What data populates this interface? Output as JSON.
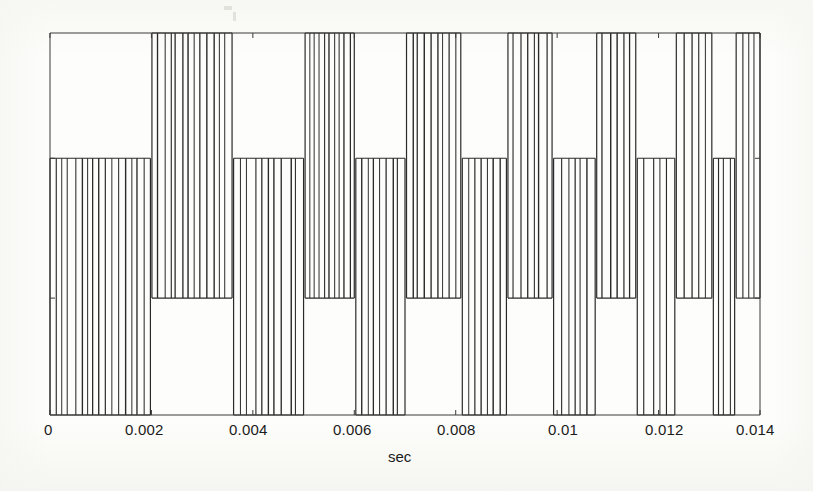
{
  "figure": {
    "background_color": "#fdfdfb",
    "line_color": "#2a2a2a",
    "axis_color": "#3a3a3a",
    "plot_box": {
      "left": 50,
      "top": 33,
      "right": 760,
      "bottom": 415
    }
  },
  "axis": {
    "x_label": "sec",
    "x_ticks": [
      "0",
      "0.002",
      "0.004",
      "0.006",
      "0.008",
      "0.01",
      "0.012",
      "0.014"
    ],
    "x_tick_values": [
      0,
      0.002,
      0.004,
      0.006,
      0.008,
      0.01,
      0.012,
      0.014
    ],
    "xlim": [
      0,
      0.014
    ],
    "y_ticks": [],
    "y_label": "",
    "grid": false,
    "box": true
  },
  "chart_data": {
    "type": "line",
    "title": "",
    "subtitle": "",
    "xlabel": "sec",
    "ylabel": "",
    "xlim": [
      0,
      0.014
    ],
    "ylim": [
      0,
      1
    ],
    "grid": false,
    "legend": null,
    "levels": {
      "high_top": 1.0,
      "high_bottom": 0.306,
      "low_top": 0.672,
      "low_bottom": 0.0
    },
    "blocks": [
      {
        "band": "low",
        "x_start": 0.0,
        "x_end": 0.00198,
        "n_lines": 15
      },
      {
        "band": "high",
        "x_start": 0.00201,
        "x_end": 0.00359,
        "n_lines": 12
      },
      {
        "band": "low",
        "x_start": 0.00362,
        "x_end": 0.005,
        "n_lines": 9
      },
      {
        "band": "high",
        "x_start": 0.00503,
        "x_end": 0.006,
        "n_lines": 9
      },
      {
        "band": "low",
        "x_start": 0.00603,
        "x_end": 0.007,
        "n_lines": 7
      },
      {
        "band": "high",
        "x_start": 0.00703,
        "x_end": 0.0081,
        "n_lines": 8
      },
      {
        "band": "low",
        "x_start": 0.00813,
        "x_end": 0.009,
        "n_lines": 6
      },
      {
        "band": "high",
        "x_start": 0.00903,
        "x_end": 0.0099,
        "n_lines": 6
      },
      {
        "band": "low",
        "x_start": 0.00993,
        "x_end": 0.01075,
        "n_lines": 5
      },
      {
        "band": "high",
        "x_start": 0.01078,
        "x_end": 0.01155,
        "n_lines": 5
      },
      {
        "band": "low",
        "x_start": 0.01158,
        "x_end": 0.01232,
        "n_lines": 4
      },
      {
        "band": "high",
        "x_start": 0.01235,
        "x_end": 0.01305,
        "n_lines": 4
      },
      {
        "band": "low",
        "x_start": 0.01308,
        "x_end": 0.0135,
        "n_lines": 3
      },
      {
        "band": "high",
        "x_start": 0.01353,
        "x_end": 0.014,
        "n_lines": 3
      }
    ]
  }
}
